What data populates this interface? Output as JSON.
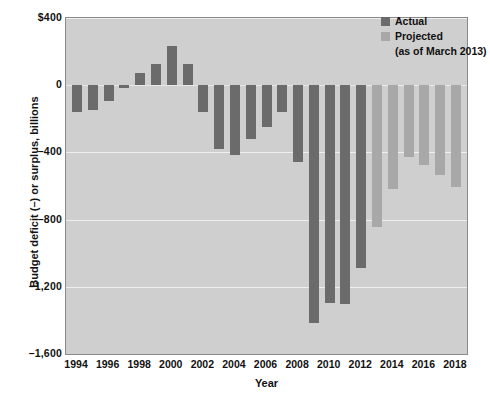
{
  "chart_data": {
    "type": "bar",
    "title": "",
    "xlabel": "Year",
    "ylabel": "Budget deficit (–) or surplus, billions",
    "ylim": [
      -1600,
      400
    ],
    "xlim": [
      1993.3,
      2018.7
    ],
    "grid": true,
    "ytick_labels": [
      "$400",
      "0",
      "–400",
      "–800",
      "–1,200",
      "–1,600"
    ],
    "ytick_values": [
      400,
      0,
      -400,
      -800,
      -1200,
      -1600
    ],
    "xtick_labels": [
      "1994",
      "1996",
      "1998",
      "2000",
      "2002",
      "2004",
      "2006",
      "2008",
      "2010",
      "2012",
      "2014",
      "2016",
      "2018"
    ],
    "xtick_values": [
      1994,
      1996,
      1998,
      2000,
      2002,
      2004,
      2006,
      2008,
      2010,
      2012,
      2014,
      2016,
      2018
    ],
    "legend_position": "top-right",
    "series": [
      {
        "name": "Actual",
        "color": "#6b6b6b",
        "categories": [
          1994,
          1995,
          1996,
          1997,
          1998,
          1999,
          2000,
          2001,
          2002,
          2003,
          2004,
          2005,
          2006,
          2007,
          2008,
          2009,
          2010,
          2011,
          2012
        ],
        "values": [
          -160,
          -145,
          -95,
          -15,
          70,
          125,
          235,
          128,
          -158,
          -378,
          -413,
          -318,
          -248,
          -161,
          -459,
          -1413,
          -1294,
          -1300,
          -1087
        ]
      },
      {
        "name": "Projected",
        "color": "#a8a8a8",
        "categories": [
          2013,
          2014,
          2015,
          2016,
          2017,
          2018
        ],
        "values": [
          -845,
          -616,
          -430,
          -476,
          -535,
          -605
        ]
      }
    ],
    "legend_entries": [
      {
        "label": "Actual",
        "color": "#6b6b6b"
      },
      {
        "label": "Projected",
        "color": "#a8a8a8"
      }
    ],
    "annotations": [
      "(as of March 2013)"
    ],
    "plot_background": "#cfcfcf"
  }
}
